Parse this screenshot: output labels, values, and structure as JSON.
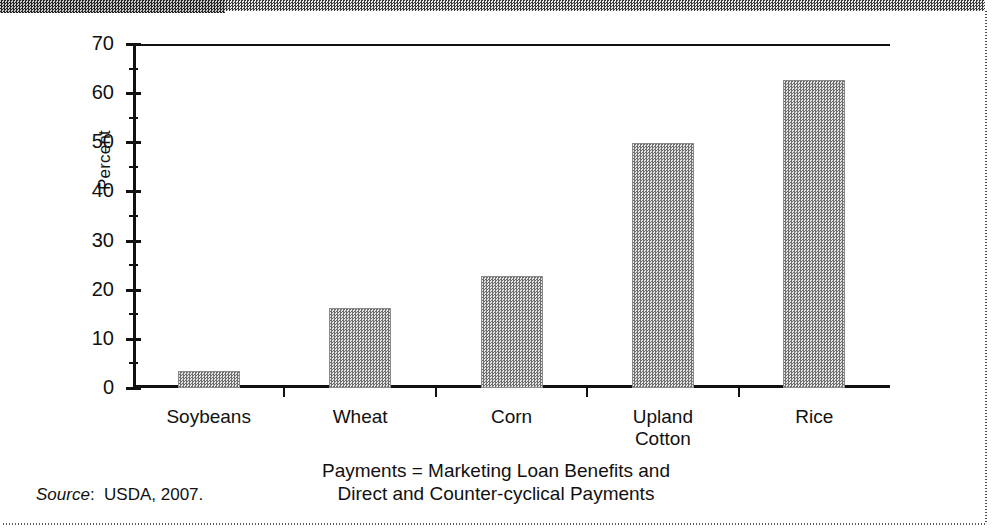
{
  "figure": {
    "source_prefix": "Source",
    "source_text": ":  USDA, 2007.",
    "caption_line1": "Payments = Marketing Loan Benefits and",
    "caption_line2": "Direct and Counter-cyclical Payments"
  },
  "chart_data": {
    "type": "bar",
    "title": "",
    "xlabel": "",
    "ylabel": "Percent",
    "ylim": [
      0,
      70
    ],
    "ytick_step": 10,
    "yticks": [
      "0",
      "10",
      "20",
      "30",
      "40",
      "50",
      "60",
      "70"
    ],
    "minor_ticks": true,
    "grid": false,
    "legend": "none",
    "categories": [
      "Soybeans",
      "Wheat",
      "Corn",
      "Upland Cotton",
      "Rice"
    ],
    "category_lines": [
      [
        "Soybeans"
      ],
      [
        "Wheat"
      ],
      [
        "Corn"
      ],
      [
        "Upland",
        "Cotton"
      ],
      [
        "Rice"
      ]
    ],
    "values": [
      3.5,
      16.3,
      22.8,
      49.9,
      62.7
    ],
    "series": [
      {
        "name": "Percent",
        "values": [
          3.5,
          16.3,
          22.8,
          49.9,
          62.7
        ]
      }
    ],
    "bar_fill": "#9a9a9a",
    "axis_color": "#111111"
  }
}
